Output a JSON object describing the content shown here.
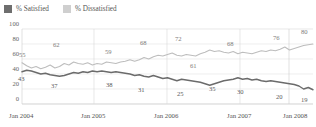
{
  "legend": {
    "items": [
      {
        "label": "% Satisfied",
        "color": "#6e6e6e",
        "key": "satisfied"
      },
      {
        "label": "% Dissatisfied",
        "color": "#cfcfcf",
        "key": "dissatisfied"
      }
    ]
  },
  "chart_data": {
    "type": "line",
    "title": "",
    "subtitle": "",
    "xlabel": "",
    "ylabel": "",
    "ylim": [
      0,
      100
    ],
    "yticks": [
      0,
      20,
      40,
      60,
      80,
      100
    ],
    "ytick_labels": [
      "0",
      "20",
      "40",
      "60",
      "80",
      "100"
    ],
    "grid": true,
    "grid_axis": "both",
    "legend_position": "top-left",
    "x_tick_labels": [
      "Jan 2004",
      "Jan 2005",
      "Jan 2006",
      "Jan 2007",
      "Jan 2008"
    ],
    "x_tick_positions": [
      0,
      12,
      24,
      36,
      48
    ],
    "x_range": [
      0,
      50
    ],
    "x_unit": "months since Jan 2004",
    "series": [
      {
        "name": "% Dissatisfied",
        "color": "#bdbdbd",
        "values": [
          55,
          51,
          48,
          50,
          47,
          49,
          52,
          48,
          50,
          54,
          52,
          56,
          54,
          53,
          55,
          52,
          54,
          53,
          56,
          55,
          54,
          56,
          57,
          59,
          57,
          59,
          62,
          60,
          63,
          65,
          64,
          66,
          68,
          65,
          64,
          66,
          65,
          64,
          67,
          69,
          72,
          70,
          71,
          69,
          68,
          70,
          67,
          69,
          68,
          67,
          69,
          71,
          70,
          72,
          71,
          73,
          76,
          72,
          74,
          76,
          78,
          79,
          80
        ],
        "annotations": [
          {
            "label": "55",
            "value": 55
          },
          {
            "label": "62",
            "value": 62
          },
          {
            "label": "59",
            "value": 59
          },
          {
            "label": "68",
            "value": 68
          },
          {
            "label": "72",
            "value": 72
          },
          {
            "label": "61",
            "value": 61
          },
          {
            "label": "68",
            "value": 68
          },
          {
            "label": "76",
            "value": 76
          },
          {
            "label": "80",
            "value": 80
          }
        ]
      },
      {
        "name": "% Satisfied",
        "color": "#6b6b6b",
        "values": [
          43,
          45,
          44,
          42,
          40,
          41,
          39,
          38,
          37,
          38,
          40,
          42,
          41,
          43,
          42,
          44,
          43,
          44,
          43,
          42,
          43,
          42,
          41,
          40,
          38,
          39,
          37,
          36,
          38,
          36,
          34,
          35,
          33,
          31,
          33,
          32,
          31,
          30,
          29,
          27,
          25,
          27,
          29,
          31,
          32,
          33,
          35,
          33,
          34,
          32,
          33,
          31,
          30,
          31,
          30,
          29,
          28,
          27,
          26,
          24,
          20,
          22,
          19
        ],
        "annotations": [
          {
            "label": "43",
            "value": 43
          },
          {
            "label": "37",
            "value": 37
          },
          {
            "label": "38",
            "value": 38
          },
          {
            "label": "31",
            "value": 31
          },
          {
            "label": "25",
            "value": 25
          },
          {
            "label": "35",
            "value": 35
          },
          {
            "label": "30",
            "value": 30
          },
          {
            "label": "20",
            "value": 20
          },
          {
            "label": "19",
            "value": 19
          }
        ]
      }
    ]
  },
  "labels": {
    "dissatisfied_points": [
      {
        "text": "55",
        "x": 19,
        "y": 52
      },
      {
        "text": "62",
        "x": 53,
        "y": 42
      },
      {
        "text": "59",
        "x": 105,
        "y": 49
      },
      {
        "text": "68",
        "x": 140,
        "y": 40
      },
      {
        "text": "72",
        "x": 175,
        "y": 36
      },
      {
        "text": "61",
        "x": 190,
        "y": 63
      },
      {
        "text": "68",
        "x": 227,
        "y": 41
      },
      {
        "text": "76",
        "x": 273,
        "y": 35
      },
      {
        "text": "80",
        "x": 301,
        "y": 29
      }
    ],
    "satisfied_points": [
      {
        "text": "43",
        "x": 18,
        "y": 76
      },
      {
        "text": "37",
        "x": 51,
        "y": 83
      },
      {
        "text": "38",
        "x": 106,
        "y": 82
      },
      {
        "text": "31",
        "x": 138,
        "y": 87
      },
      {
        "text": "25",
        "x": 177,
        "y": 91
      },
      {
        "text": "35",
        "x": 209,
        "y": 86
      },
      {
        "text": "30",
        "x": 237,
        "y": 89
      },
      {
        "text": "20",
        "x": 276,
        "y": 94
      },
      {
        "text": "19",
        "x": 301,
        "y": 97
      }
    ]
  }
}
